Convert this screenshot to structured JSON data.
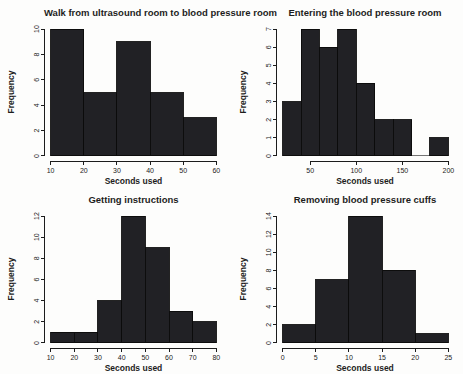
{
  "figure": {
    "background": "#fdfdfc",
    "bar_fill": "#212125",
    "bar_stroke": "#0b0b0b",
    "axis_color": "#1c1c1c",
    "text_color": "#1d1d1d"
  },
  "chart_data": [
    {
      "type": "bar",
      "title": "Walk from ultrasound room to blood pressure room",
      "xlabel": "Seconds used",
      "ylabel": "Frequency",
      "bin_start": 10,
      "bin_width": 10,
      "categories": [
        "10-20",
        "20-30",
        "30-40",
        "40-50",
        "50-60"
      ],
      "values": [
        10,
        5,
        9,
        5,
        3
      ],
      "x_ticks": [
        10,
        20,
        30,
        40,
        50,
        60
      ],
      "y_ticks": [
        0,
        2,
        4,
        6,
        8,
        10
      ],
      "xlim": [
        10,
        60
      ],
      "ylim": [
        0,
        10
      ],
      "grid": false,
      "legend": false
    },
    {
      "type": "bar",
      "title": "Entering the blood pressure room",
      "xlabel": "Seconds used",
      "ylabel": "Frequency",
      "bin_start": 20,
      "bin_width": 20,
      "categories": [
        "20-40",
        "40-60",
        "60-80",
        "80-100",
        "100-120",
        "120-140",
        "140-160",
        "160-180",
        "180-200"
      ],
      "values": [
        3,
        7,
        6,
        7,
        4,
        2,
        2,
        0,
        1
      ],
      "x_ticks": [
        50,
        100,
        150,
        200
      ],
      "y_ticks": [
        0,
        1,
        2,
        3,
        4,
        5,
        6,
        7
      ],
      "xlim": [
        20,
        200
      ],
      "ylim": [
        0,
        7
      ],
      "grid": false,
      "legend": false
    },
    {
      "type": "bar",
      "title": "Getting instructions",
      "xlabel": "Seconds used",
      "ylabel": "Frequency",
      "bin_start": 10,
      "bin_width": 10,
      "categories": [
        "10-20",
        "20-30",
        "30-40",
        "40-50",
        "50-60",
        "60-70",
        "70-80"
      ],
      "values": [
        1,
        1,
        4,
        12,
        9,
        3,
        2
      ],
      "x_ticks": [
        10,
        20,
        30,
        40,
        50,
        60,
        70,
        80
      ],
      "y_ticks": [
        0,
        2,
        4,
        6,
        8,
        10,
        12
      ],
      "xlim": [
        10,
        80
      ],
      "ylim": [
        0,
        12
      ],
      "grid": false,
      "legend": false
    },
    {
      "type": "bar",
      "title": "Removing blood pressure cuffs",
      "xlabel": "Seconds used",
      "ylabel": "Frequency",
      "bin_start": 0,
      "bin_width": 5,
      "categories": [
        "0-5",
        "5-10",
        "10-15",
        "15-20",
        "20-25"
      ],
      "values": [
        2,
        7,
        14,
        8,
        1
      ],
      "x_ticks": [
        0,
        5,
        10,
        15,
        20,
        25
      ],
      "y_ticks": [
        0,
        2,
        4,
        6,
        8,
        10,
        12,
        14
      ],
      "xlim": [
        0,
        25
      ],
      "ylim": [
        0,
        14
      ],
      "grid": false,
      "legend": false
    }
  ]
}
